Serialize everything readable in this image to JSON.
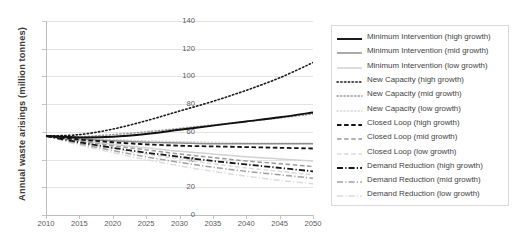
{
  "chart_data": {
    "type": "line",
    "title": "",
    "xlabel": "",
    "ylabel": "Annual waste arisings (million tonnes)",
    "xlim": [
      2010,
      2050
    ],
    "ylim": [
      0,
      140
    ],
    "ytick_labels": [
      "0",
      "20",
      "40",
      "60",
      "80",
      "100",
      "120",
      "140"
    ],
    "ytick_values": [
      0,
      20,
      40,
      60,
      80,
      100,
      120,
      140
    ],
    "xtick_labels": [
      "2010",
      "2015",
      "2020",
      "2025",
      "2030",
      "2035",
      "2040",
      "2045",
      "2050"
    ],
    "xtick_values": [
      2010,
      2015,
      2020,
      2025,
      2030,
      2035,
      2040,
      2045,
      2050
    ],
    "grid": "horizontal",
    "legend_position": "right",
    "x": [
      2010,
      2015,
      2020,
      2025,
      2030,
      2035,
      2040,
      2045,
      2050
    ],
    "series": [
      {
        "name": "Minimum Intervention (high growth)",
        "style": "solid",
        "color": "#101010",
        "width": 1.9,
        "values": [
          57,
          56,
          56.5,
          58.5,
          61.5,
          64.5,
          67.5,
          70.5,
          74
        ]
      },
      {
        "name": "Minimum Intervention (mid growth)",
        "style": "solid",
        "color": "#8c8c8c",
        "width": 1.5,
        "values": [
          57,
          55,
          53.5,
          52.5,
          52,
          51.5,
          51.5,
          51.5,
          51.5
        ]
      },
      {
        "name": "Minimum Intervention (low growth)",
        "style": "solid",
        "color": "#d2d2d2",
        "width": 1.5,
        "values": [
          57,
          54,
          51,
          48.5,
          46,
          44,
          42,
          40.5,
          39
        ]
      },
      {
        "name": "New Capacity (high growth)",
        "style": "dotted",
        "color": "#1a1a1a",
        "width": 1.6,
        "values": [
          57,
          58,
          62,
          68,
          75,
          82,
          90,
          99,
          110
        ]
      },
      {
        "name": "New Capacity (mid growth)",
        "style": "dotted",
        "color": "#9a9a9a",
        "width": 1.5,
        "values": [
          57,
          56.5,
          58,
          60,
          62.5,
          65,
          67.5,
          70,
          73
        ]
      },
      {
        "name": "New Capacity (low growth)",
        "style": "dotted",
        "color": "#d8d8d8",
        "width": 1.5,
        "values": [
          57,
          55.5,
          54.5,
          53.5,
          53,
          52.5,
          52,
          52,
          52
        ]
      },
      {
        "name": "Closed Loop (high growth)",
        "style": "dashed",
        "color": "#141414",
        "width": 1.8,
        "values": [
          57,
          54.5,
          52.5,
          51,
          50,
          49.5,
          49,
          48.5,
          48
        ]
      },
      {
        "name": "Closed Loop (mid growth)",
        "style": "dashed",
        "color": "#9a9a9a",
        "width": 1.5,
        "values": [
          57,
          53.5,
          50,
          47,
          44,
          41.5,
          39,
          37,
          35
        ]
      },
      {
        "name": "Closed Loop (low growth)",
        "style": "dashed",
        "color": "#dadada",
        "width": 1.5,
        "values": [
          57,
          52.5,
          48,
          44,
          40.5,
          37,
          34,
          31.5,
          29
        ]
      },
      {
        "name": "Demand Reduction (high growth)",
        "style": "dashdot",
        "color": "#161616",
        "width": 1.8,
        "values": [
          57,
          52.5,
          48.5,
          45,
          42,
          39,
          36.5,
          34,
          31.5
        ]
      },
      {
        "name": "Demand Reduction (mid growth)",
        "style": "dashdot",
        "color": "#a0a0a0",
        "width": 1.5,
        "values": [
          57,
          51.5,
          46.5,
          42,
          38,
          34.5,
          31.5,
          29,
          26.5
        ]
      },
      {
        "name": "Demand Reduction (low growth)",
        "style": "dashdot",
        "color": "#dcdcdc",
        "width": 1.5,
        "values": [
          57,
          50.5,
          45,
          40,
          35.5,
          31.5,
          28,
          25,
          22.5
        ]
      }
    ]
  }
}
